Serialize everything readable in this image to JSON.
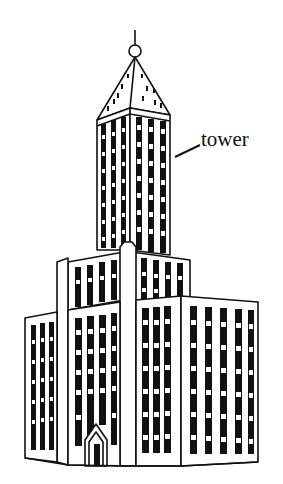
{
  "figure": {
    "label": {
      "text": "tower",
      "points_to": "tower"
    },
    "colors": {
      "ink": "#111111",
      "background": "#ffffff"
    },
    "parts": [
      "spire",
      "pyramid-roof",
      "tower",
      "middle-tier",
      "lower-wings",
      "entrance"
    ]
  }
}
